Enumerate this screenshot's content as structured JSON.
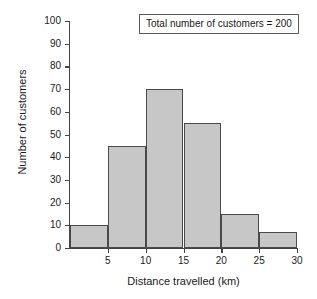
{
  "chart_data": {
    "type": "bar",
    "title": "",
    "subtitle": "",
    "xlabel": "Distance travelled (km)",
    "ylabel": "Number of customers",
    "categories": [
      "0-5",
      "5-10",
      "10-15",
      "15-20",
      "20-25",
      "25-30"
    ],
    "bin_edges": [
      0,
      5,
      10,
      15,
      20,
      25,
      30
    ],
    "values": [
      10,
      45,
      70,
      55,
      15,
      7
    ],
    "xlim": [
      0,
      30
    ],
    "ylim": [
      0,
      100
    ],
    "xticks": [
      5,
      10,
      15,
      20,
      25,
      30
    ],
    "xtick_labels": [
      "5",
      "10",
      "15",
      "20",
      "25",
      "30"
    ],
    "yticks": [
      0,
      10,
      20,
      30,
      40,
      50,
      60,
      70,
      80,
      90,
      100
    ],
    "ytick_labels": [
      "0",
      "10",
      "20",
      "30",
      "40",
      "50",
      "60",
      "70",
      "80",
      "90",
      "100"
    ],
    "grid": false,
    "legend": "none",
    "bar_fill_color": "#c7c7c7",
    "bar_edge_color": "#4a4a4a",
    "axis_color": "#444444",
    "background_color": "#ffffff",
    "annotations": [
      {
        "name": "total-customers",
        "text": "Total number of customers = 200",
        "value": 200,
        "position": "top-right",
        "boxed": true
      }
    ]
  }
}
